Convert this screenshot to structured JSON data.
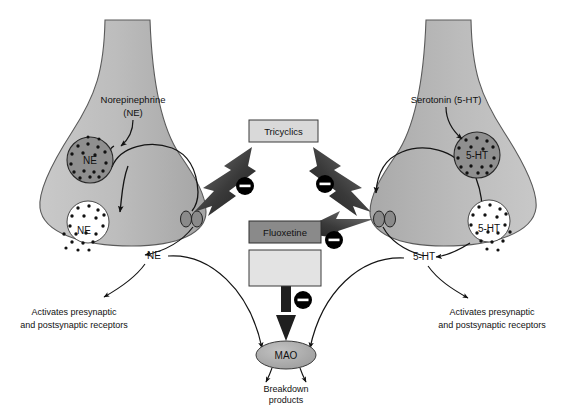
{
  "figure": {
    "background_color": "#ffffff",
    "neuron_fill": "#b5b5b5",
    "neuron_stroke": "#555555",
    "vesicle_dark_fill": "#8f8f8f",
    "vesicle_light_fill": "#ffffff",
    "arrow_dark": "#2b2b2b",
    "minus_circle_color": "#000000",
    "box_light_fill": "#d9d9d9",
    "box_dark_fill": "#8a8a8a",
    "mao_fill": "#a8a8a8"
  },
  "left_neuron": {
    "name": "presynaptic-norepinephrine-neuron",
    "transmitter_label_line1": "Norepinephrine",
    "transmitter_label_line2": "(NE)",
    "vesicle_storage_label": "NE",
    "vesicle_release_label": "NE",
    "cleft_transmitter_label": "NE",
    "receptor_effect_line1": "Activates presynaptic",
    "receptor_effect_line2": "and postsynaptic receptors"
  },
  "right_neuron": {
    "name": "presynaptic-serotonin-neuron",
    "transmitter_label": "Serotonin (5-HT)",
    "vesicle_storage_label": "5-HT",
    "vesicle_release_label": "5-HT",
    "cleft_transmitter_label": "5-HT",
    "receptor_effect_line1": "Activates presynaptic",
    "receptor_effect_line2": "and postsynaptic receptors"
  },
  "drug_boxes": [
    {
      "id": "tricyclics",
      "label": "Tricyclics",
      "style": "light",
      "targets": [
        "NE reuptake",
        "5-HT reuptake"
      ]
    },
    {
      "id": "fluoxetine",
      "label": "Fluoxetine",
      "style": "dark",
      "targets": [
        "5-HT reuptake"
      ]
    },
    {
      "id": "blank-drug",
      "label": "",
      "style": "light",
      "targets": [
        "MAO"
      ]
    }
  ],
  "inhibition_markers": [
    {
      "id": "minus-left-reuptake",
      "symbol": "−"
    },
    {
      "id": "minus-right-reuptake",
      "symbol": "−"
    },
    {
      "id": "minus-fluoxetine",
      "symbol": "−"
    },
    {
      "id": "minus-mao",
      "symbol": "−"
    }
  ],
  "enzyme": {
    "label": "MAO",
    "product_line1": "Breakdown",
    "product_line2": "products"
  }
}
